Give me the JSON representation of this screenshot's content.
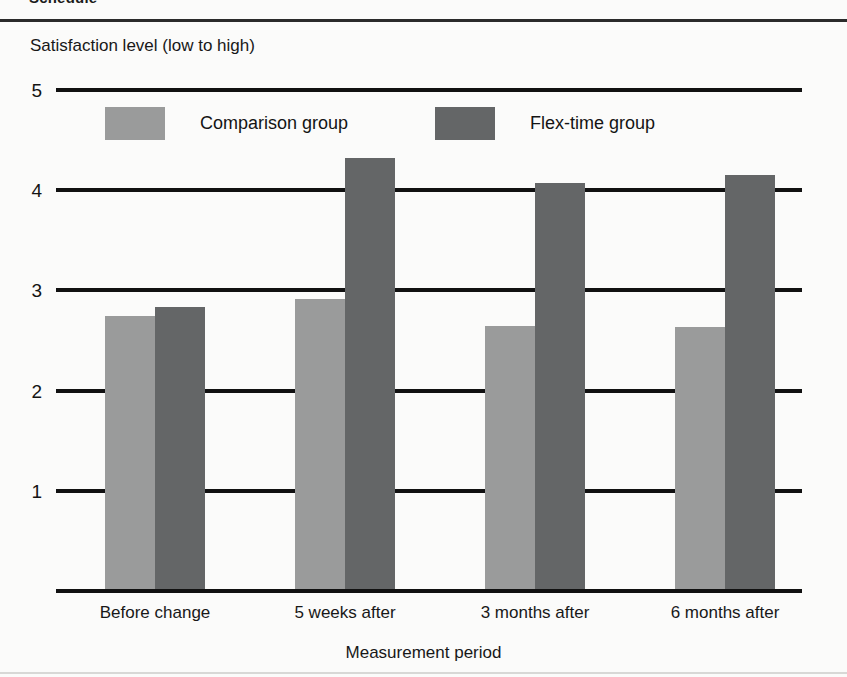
{
  "page": {
    "header_word": "Schedule"
  },
  "chart_data": {
    "type": "bar",
    "title": "",
    "xlabel": "Measurement period",
    "ylabel": "Satisfaction level  (low to high)",
    "categories": [
      "Before change",
      "5 weeks after",
      "3 months after",
      "6 months after"
    ],
    "series": [
      {
        "name": "Comparison group",
        "color": "#9a9b9b",
        "values": [
          2.72,
          2.89,
          2.62,
          2.61
        ]
      },
      {
        "name": "Flex-time group",
        "color": "#646667",
        "values": [
          2.81,
          4.3,
          4.05,
          4.13
        ]
      }
    ],
    "ylim": [
      0,
      5
    ],
    "yticks": [
      "1",
      "2",
      "3",
      "4",
      "5"
    ],
    "grid": "horizontal",
    "legend_position": "inside-top"
  }
}
